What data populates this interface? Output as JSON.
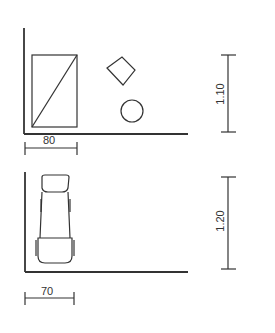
{
  "diagram": {
    "top_panel": {
      "items": [
        "rectangle-with-diagonal",
        "rotated-square",
        "circle"
      ],
      "width_dimension": "80",
      "height_dimension": "1.10"
    },
    "bottom_panel": {
      "items": [
        "wheelchair-topview"
      ],
      "width_dimension": "70",
      "height_dimension": "1.20"
    },
    "stroke_color": "#333333"
  }
}
